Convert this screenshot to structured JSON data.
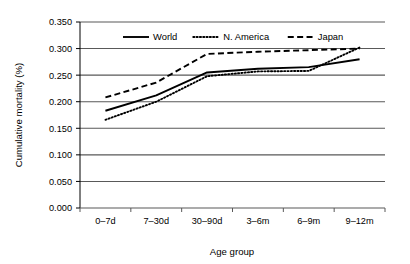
{
  "chart_data": {
    "type": "line",
    "title": "",
    "xlabel": "Age group",
    "ylabel": "Cumulative mortality (%)",
    "categories": [
      "0–7d",
      "7–30d",
      "30–90d",
      "3–6m",
      "6–9m",
      "9–12m"
    ],
    "ylim": [
      0.0,
      0.35
    ],
    "yticks": [
      "0.000",
      "0.050",
      "0.100",
      "0.150",
      "0.200",
      "0.250",
      "0.300",
      "0.350"
    ],
    "ytick_values": [
      0.0,
      0.05,
      0.1,
      0.15,
      0.2,
      0.25,
      0.3,
      0.35
    ],
    "grid": "horizontal",
    "legend_position": "top-center-inside",
    "series": [
      {
        "name": "World",
        "style": "solid",
        "color": "#000000",
        "values": [
          0.183,
          0.212,
          0.255,
          0.262,
          0.265,
          0.28
        ]
      },
      {
        "name": "N. America",
        "style": "dotted",
        "color": "#000000",
        "values": [
          0.166,
          0.2,
          0.248,
          0.257,
          0.258,
          0.302
        ]
      },
      {
        "name": "Japan",
        "style": "dashed",
        "color": "#000000",
        "values": [
          0.208,
          0.236,
          0.29,
          0.294,
          0.297,
          0.3
        ]
      }
    ]
  },
  "legend": {
    "items": [
      {
        "label": "World"
      },
      {
        "label": "N. America"
      },
      {
        "label": "Japan"
      }
    ]
  }
}
